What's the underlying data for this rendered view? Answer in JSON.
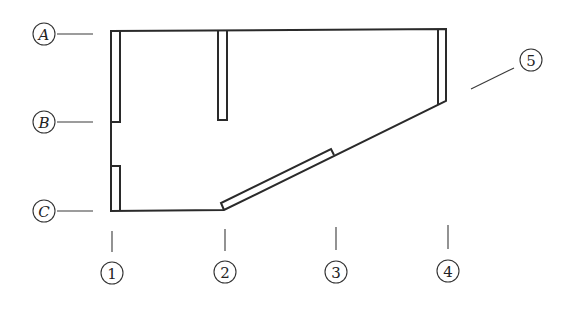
{
  "diagram": {
    "type": "structural floor plan with grid axes",
    "colors": {
      "line": "#2a2a2a",
      "background": "#ffffff"
    },
    "row_axes": [
      {
        "label": "A",
        "cx": 44,
        "cy": 34,
        "leader": [
          57,
          34,
          93,
          34
        ]
      },
      {
        "label": "B",
        "cx": 44,
        "cy": 122,
        "leader": [
          57,
          122,
          93,
          122
        ]
      },
      {
        "label": "C",
        "cx": 44,
        "cy": 211,
        "leader": [
          57,
          211,
          93,
          211
        ]
      }
    ],
    "column_axes": [
      {
        "label": "1",
        "cx": 112,
        "cy": 273,
        "leader": [
          112,
          231,
          112,
          252
        ]
      },
      {
        "label": "2",
        "cx": 225,
        "cy": 272,
        "leader": [
          225,
          229,
          225,
          251
        ]
      },
      {
        "label": "3",
        "cx": 336,
        "cy": 272,
        "leader": [
          336,
          227,
          336,
          250
        ]
      },
      {
        "label": "4",
        "cx": 448,
        "cy": 271,
        "leader": [
          448,
          225,
          448,
          249
        ]
      }
    ],
    "callouts": [
      {
        "label": "5",
        "cx": 531,
        "cy": 60,
        "leader": [
          471,
          89,
          514,
          68
        ]
      }
    ],
    "outline": "M111,31 L446,29 L446,101 L224,210 L111,211 Z",
    "wall_segments": [
      {
        "name": "wall-segment-A-1-2",
        "points": "111,31 111,122 120,122 120,31"
      },
      {
        "name": "wall-segment-B-C-1",
        "points": "111,166 120,166 120,211"
      },
      {
        "name": "wall-segment-A-2",
        "points": "218,31 218,120 227,120 227,31"
      },
      {
        "name": "wall-segment-4",
        "points": "438,29 438,105"
      },
      {
        "name": "wall-segment-diagonal",
        "points": "224,210 221,203 331,149 334,155"
      }
    ]
  }
}
